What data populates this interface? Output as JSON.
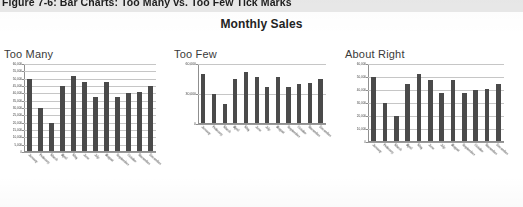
{
  "caption": "Figure 7-6: Bar Charts: Too Many vs. Too Few Tick Marks",
  "figure_title": "Monthly Sales",
  "panels": [
    {
      "title": "Too Many"
    },
    {
      "title": "Too Few"
    },
    {
      "title": "About Right"
    }
  ],
  "chart_data": [
    {
      "type": "bar",
      "title": "Too Many",
      "xlabel": "",
      "ylabel": "",
      "categories": [
        "January",
        "February",
        "March",
        "April",
        "May",
        "June",
        "July",
        "August",
        "September",
        "October",
        "November",
        "December"
      ],
      "values": [
        50000,
        30000,
        20000,
        45000,
        52000,
        47500,
        37500,
        47500,
        37500,
        40000,
        41000,
        45000
      ],
      "ylim": [
        0,
        60000
      ],
      "ytick_values": [
        0,
        5000,
        10000,
        15000,
        20000,
        25000,
        30000,
        35000,
        40000,
        45000,
        50000,
        55000,
        60000
      ],
      "ytick_labels": [
        "0",
        "5,000",
        "10,000",
        "15,000",
        "20,000",
        "25,000",
        "30,000",
        "35,000",
        "40,000",
        "45,000",
        "50,000",
        "55,000",
        "60,000"
      ],
      "grid": true,
      "legend": "none",
      "bar_color": "#4a4a4a"
    },
    {
      "type": "bar",
      "title": "Too Few",
      "xlabel": "",
      "ylabel": "",
      "categories": [
        "January",
        "February",
        "March",
        "April",
        "May",
        "June",
        "July",
        "August",
        "September",
        "October",
        "November",
        "December"
      ],
      "values": [
        50000,
        30000,
        20000,
        45000,
        52000,
        47500,
        37500,
        47500,
        37500,
        40000,
        41000,
        45000
      ],
      "ylim": [
        0,
        60000
      ],
      "ytick_values": [
        0,
        30000,
        60000
      ],
      "ytick_labels": [
        "0",
        "30,000",
        "60,000"
      ],
      "grid": true,
      "legend": "none",
      "bar_color": "#4a4a4a"
    },
    {
      "type": "bar",
      "title": "About Right",
      "xlabel": "",
      "ylabel": "",
      "categories": [
        "January",
        "February",
        "March",
        "April",
        "May",
        "June",
        "July",
        "August",
        "September",
        "October",
        "November",
        "December"
      ],
      "values": [
        50000,
        30000,
        20000,
        45000,
        52000,
        47500,
        37500,
        47500,
        37500,
        40000,
        41000,
        45000
      ],
      "ylim": [
        0,
        60000
      ],
      "ytick_values": [
        0,
        10000,
        20000,
        30000,
        40000,
        50000,
        60000
      ],
      "ytick_labels": [
        "0",
        "10,000",
        "20,000",
        "30,000",
        "40,000",
        "50,000",
        "60,000"
      ],
      "grid": true,
      "legend": "none",
      "bar_color": "#4a4a4a"
    }
  ],
  "colors": {
    "bar": "#4a4a4a",
    "gridline": "#c6c6c6",
    "axis": "#8f8f8f",
    "banner": "#e9e9e9",
    "text": "#2b2b2b"
  }
}
